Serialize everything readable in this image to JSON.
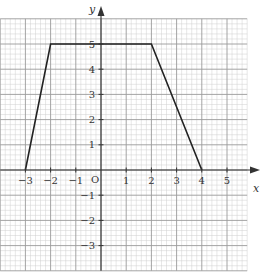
{
  "chart_data": {
    "type": "line",
    "title": "",
    "xlabel": "x",
    "ylabel": "y",
    "origin_label": "O",
    "xlim": [
      -4,
      5.8
    ],
    "ylim": [
      -4,
      6
    ],
    "grid": true,
    "grid_minor_step": 0.2,
    "grid_major_step": 1,
    "x_ticks": [
      -3,
      -2,
      -1,
      1,
      2,
      3,
      4,
      5
    ],
    "y_ticks": [
      -3,
      -2,
      -1,
      1,
      2,
      3,
      4,
      5
    ],
    "x_tick_labels": [
      "−3",
      "−2",
      "−1",
      "1",
      "2",
      "3",
      "4",
      "5"
    ],
    "y_tick_labels": [
      "−3",
      "−2",
      "−1",
      "1",
      "2",
      "3",
      "4",
      "5"
    ],
    "series": [
      {
        "name": "trapezoid",
        "x": [
          -3,
          -2,
          2,
          4
        ],
        "y": [
          0,
          5,
          5,
          0
        ],
        "color": "#222222"
      }
    ],
    "colors": {
      "minor_grid": "#cfcfcf",
      "major_grid": "#9a9a9a",
      "axis": "#333333",
      "line": "#222222"
    }
  }
}
